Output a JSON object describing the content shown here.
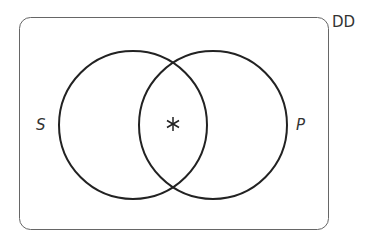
{
  "diagram": {
    "type": "venn",
    "universe_label": "DD",
    "sets": [
      {
        "label": "S",
        "cx": 133,
        "cy": 125,
        "r": 75
      },
      {
        "label": "P",
        "cx": 212,
        "cy": 125,
        "r": 75
      }
    ],
    "marker": {
      "symbol": "*",
      "region": "S∩P"
    },
    "colors": {
      "stroke": "#222222",
      "frame": "#555555",
      "background": "#ffffff"
    }
  }
}
